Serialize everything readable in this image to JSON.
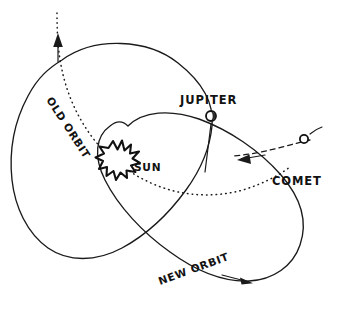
{
  "figure": {
    "background_color": "#ffffff",
    "ink_color": "#1a1a1a"
  },
  "labels": {
    "sun": "SUN",
    "jupiter": "JUPITER",
    "comet": "COMET",
    "old_orbit": "OLD ORBIT",
    "new_orbit": "NEW ORBIT"
  },
  "icons": {
    "sun": "sun-starburst-icon",
    "jupiter": "planet-circle-icon",
    "comet": "comet-circle-icon",
    "old_orbit_arrow": "arrow-up-icon",
    "comet_arrow": "arrow-left-icon",
    "new_orbit_arrow": "arrow-right-icon"
  },
  "elements": {
    "jupiter_orbit": "large solid circle",
    "old_orbit_path": "dotted open curve leaving frame upward",
    "new_orbit_path": "large tilted solid ellipse",
    "comet_incoming": "dashed trajectory entering from right"
  }
}
